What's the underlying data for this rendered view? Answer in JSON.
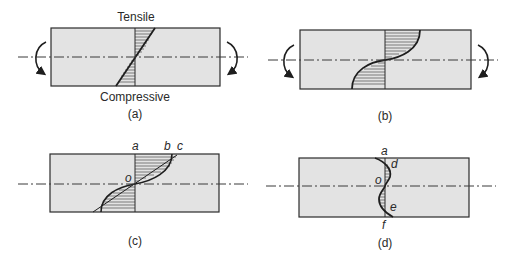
{
  "figure": {
    "colors": {
      "beam_fill": "#e3e3e3",
      "stroke": "#2b2b2b",
      "axis": "#3a3a3a"
    }
  },
  "panels": [
    {
      "id": "a",
      "caption": "(a)",
      "top_label": "Tensile",
      "bottom_label": "Compressive",
      "profile": "linear",
      "moment_arrows": true
    },
    {
      "id": "b",
      "caption": "(b)",
      "profile": "nonlinear-plastic",
      "moment_arrows": true
    },
    {
      "id": "c",
      "caption": "(c)",
      "point_labels": {
        "a": "a",
        "b": "b",
        "c": "c",
        "o": "o"
      },
      "profile": "residual-superposition",
      "moment_arrows": false
    },
    {
      "id": "d",
      "caption": "(d)",
      "point_labels": {
        "a": "a",
        "d": "d",
        "o": "o",
        "e": "e",
        "f": "f"
      },
      "profile": "residual-stress",
      "moment_arrows": false
    }
  ]
}
